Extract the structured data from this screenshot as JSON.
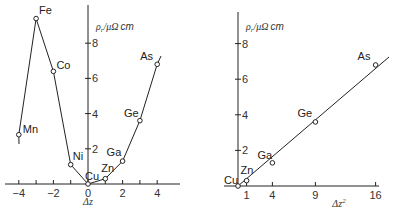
{
  "chart_data": [
    {
      "type": "line",
      "title": "",
      "xlabel": "Δz",
      "ylabel": "ρ_r / μΩ cm",
      "xlim": [
        -4.2,
        4.7
      ],
      "ylim": [
        0,
        10
      ],
      "xticks": [
        -4,
        -3,
        -2,
        -1,
        0,
        1,
        2,
        3,
        4
      ],
      "xtick_labels": [
        "−4",
        "",
        "−2",
        "",
        "0",
        "",
        "2",
        "",
        "4"
      ],
      "yticks": [
        2,
        4,
        6,
        8
      ],
      "ytick_labels": [
        "2",
        "4",
        "6",
        "8"
      ],
      "grid": false,
      "legend": null,
      "series": [
        {
          "name": "residual resistivity",
          "points": [
            {
              "label": "Mn",
              "x": -4,
              "y": 2.8
            },
            {
              "label": "Fe",
              "x": -3,
              "y": 9.4
            },
            {
              "label": "Co",
              "x": -2,
              "y": 6.4
            },
            {
              "label": "Ni",
              "x": -1,
              "y": 1.1
            },
            {
              "label": "Cu",
              "x": 0,
              "y": 0
            },
            {
              "label": "Zn",
              "x": 1,
              "y": 0.3
            },
            {
              "label": "Ga",
              "x": 2,
              "y": 1.3
            },
            {
              "label": "Ge",
              "x": 3,
              "y": 3.6
            },
            {
              "label": "As",
              "x": 4,
              "y": 6.8
            }
          ]
        }
      ]
    },
    {
      "type": "line",
      "title": "",
      "xlabel": "Δz²",
      "ylabel": "ρ_r / μΩ cm",
      "xlim": [
        -1.6,
        16.5
      ],
      "ylim": [
        0,
        10
      ],
      "xticks": [
        1,
        4,
        9,
        16
      ],
      "xtick_labels": [
        "1",
        "4",
        "9",
        "16"
      ],
      "yticks": [
        2,
        4,
        6,
        8
      ],
      "ytick_labels": [
        "2",
        "4",
        "6",
        "8"
      ],
      "grid": false,
      "legend": null,
      "series": [
        {
          "name": "residual resistivity vs Δz²",
          "points": [
            {
              "label": "Cu",
              "x": 0,
              "y": 0
            },
            {
              "label": "Zn",
              "x": 1,
              "y": 0.3
            },
            {
              "label": "Ga",
              "x": 4,
              "y": 1.3
            },
            {
              "label": "Ge",
              "x": 9,
              "y": 3.6
            },
            {
              "label": "As",
              "x": 16,
              "y": 6.8
            }
          ],
          "fit": "linear"
        }
      ]
    }
  ]
}
